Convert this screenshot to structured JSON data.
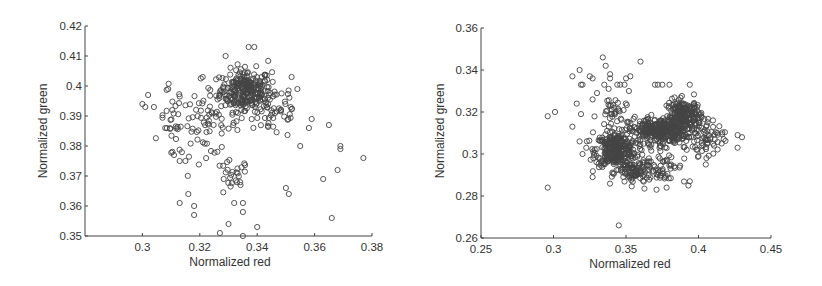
{
  "chart_data": [
    {
      "type": "scatter",
      "title": "",
      "xlabel": "Normalized red",
      "ylabel": "Normalized green",
      "xlim": [
        0.28,
        0.38
      ],
      "ylim": [
        0.35,
        0.42
      ],
      "xticks": [
        "0.3",
        "0.32",
        "0.34",
        "0.36",
        "0.38"
      ],
      "xtick_values": [
        0.3,
        0.32,
        0.34,
        0.36,
        0.38
      ],
      "yticks": [
        "0.35",
        "0.36",
        "0.37",
        "0.38",
        "0.39",
        "0.4",
        "0.41",
        "0.42"
      ],
      "ytick_values": [
        0.35,
        0.36,
        0.37,
        0.38,
        0.39,
        0.4,
        0.41,
        0.42
      ],
      "grid": false,
      "marker": "open-circle",
      "box": {
        "left": 85,
        "top": 26,
        "right": 372,
        "bottom": 236
      },
      "clusters": [
        {
          "cx": 0.336,
          "cy": 0.3985,
          "sx": 0.0045,
          "sy": 0.0035,
          "n": 260
        },
        {
          "cx": 0.322,
          "cy": 0.387,
          "sx": 0.006,
          "sy": 0.005,
          "n": 70
        },
        {
          "cx": 0.346,
          "cy": 0.392,
          "sx": 0.005,
          "sy": 0.005,
          "n": 50
        },
        {
          "cx": 0.331,
          "cy": 0.369,
          "sx": 0.003,
          "sy": 0.003,
          "n": 25
        },
        {
          "cx": 0.31,
          "cy": 0.388,
          "sx": 0.002,
          "sy": 0.006,
          "n": 25
        }
      ],
      "points": [
        [
          0.3,
          0.394
        ],
        [
          0.302,
          0.397
        ],
        [
          0.301,
          0.393
        ],
        [
          0.304,
          0.393
        ],
        [
          0.309,
          0.399
        ],
        [
          0.311,
          0.377
        ],
        [
          0.313,
          0.375
        ],
        [
          0.315,
          0.375
        ],
        [
          0.313,
          0.361
        ],
        [
          0.316,
          0.364
        ],
        [
          0.318,
          0.36
        ],
        [
          0.318,
          0.357
        ],
        [
          0.327,
          0.351
        ],
        [
          0.33,
          0.354
        ],
        [
          0.335,
          0.35
        ],
        [
          0.34,
          0.353
        ],
        [
          0.332,
          0.361
        ],
        [
          0.335,
          0.361
        ],
        [
          0.335,
          0.358
        ],
        [
          0.35,
          0.366
        ],
        [
          0.351,
          0.364
        ],
        [
          0.355,
          0.38
        ],
        [
          0.358,
          0.386
        ],
        [
          0.359,
          0.389
        ],
        [
          0.363,
          0.369
        ],
        [
          0.365,
          0.387
        ],
        [
          0.366,
          0.356
        ],
        [
          0.368,
          0.372
        ],
        [
          0.369,
          0.379
        ],
        [
          0.369,
          0.38
        ],
        [
          0.377,
          0.376
        ],
        [
          0.339,
          0.413
        ],
        [
          0.337,
          0.413
        ],
        [
          0.329,
          0.41
        ],
        [
          0.321,
          0.403
        ],
        [
          0.352,
          0.403
        ],
        [
          0.354,
          0.399
        ]
      ]
    },
    {
      "type": "scatter",
      "title": "",
      "xlabel": "Normalized red",
      "ylabel": "Normalized green",
      "xlim": [
        0.25,
        0.45
      ],
      "ylim": [
        0.26,
        0.36
      ],
      "xticks": [
        "0.25",
        "0.3",
        "0.35",
        "0.4",
        "0.45"
      ],
      "xtick_values": [
        0.25,
        0.3,
        0.35,
        0.4,
        0.45
      ],
      "yticks": [
        "0.26",
        "0.28",
        "0.3",
        "0.32",
        "0.34",
        "0.36"
      ],
      "ytick_values": [
        0.26,
        0.28,
        0.3,
        0.32,
        0.34,
        0.36
      ],
      "grid": false,
      "marker": "open-circle",
      "box": {
        "left": 481,
        "top": 28,
        "right": 771,
        "bottom": 238
      },
      "clusters": [
        {
          "cx": 0.343,
          "cy": 0.302,
          "sx": 0.007,
          "sy": 0.004,
          "n": 300
        },
        {
          "cx": 0.372,
          "cy": 0.311,
          "sx": 0.01,
          "sy": 0.003,
          "n": 300
        },
        {
          "cx": 0.39,
          "cy": 0.318,
          "sx": 0.006,
          "sy": 0.004,
          "n": 220
        },
        {
          "cx": 0.356,
          "cy": 0.291,
          "sx": 0.006,
          "sy": 0.003,
          "n": 90
        },
        {
          "cx": 0.405,
          "cy": 0.307,
          "sx": 0.006,
          "sy": 0.004,
          "n": 60
        },
        {
          "cx": 0.375,
          "cy": 0.296,
          "sx": 0.008,
          "sy": 0.005,
          "n": 60
        },
        {
          "cx": 0.34,
          "cy": 0.318,
          "sx": 0.005,
          "sy": 0.005,
          "n": 40
        }
      ],
      "points": [
        [
          0.296,
          0.284
        ],
        [
          0.296,
          0.318
        ],
        [
          0.301,
          0.32
        ],
        [
          0.313,
          0.313
        ],
        [
          0.313,
          0.337
        ],
        [
          0.316,
          0.324
        ],
        [
          0.318,
          0.34
        ],
        [
          0.319,
          0.333
        ],
        [
          0.32,
          0.333
        ],
        [
          0.319,
          0.319
        ],
        [
          0.318,
          0.306
        ],
        [
          0.32,
          0.3
        ],
        [
          0.327,
          0.289
        ],
        [
          0.325,
          0.337
        ],
        [
          0.327,
          0.336
        ],
        [
          0.327,
          0.326
        ],
        [
          0.33,
          0.329
        ],
        [
          0.334,
          0.346
        ],
        [
          0.335,
          0.333
        ],
        [
          0.336,
          0.342
        ],
        [
          0.338,
          0.331
        ],
        [
          0.339,
          0.336
        ],
        [
          0.339,
          0.338
        ],
        [
          0.344,
          0.333
        ],
        [
          0.346,
          0.333
        ],
        [
          0.349,
          0.333
        ],
        [
          0.35,
          0.336
        ],
        [
          0.352,
          0.33
        ],
        [
          0.353,
          0.337
        ],
        [
          0.36,
          0.344
        ],
        [
          0.345,
          0.266
        ],
        [
          0.37,
          0.333
        ],
        [
          0.372,
          0.333
        ],
        [
          0.375,
          0.333
        ],
        [
          0.38,
          0.333
        ],
        [
          0.394,
          0.333
        ],
        [
          0.371,
          0.283
        ],
        [
          0.378,
          0.284
        ],
        [
          0.393,
          0.285
        ],
        [
          0.394,
          0.287
        ],
        [
          0.405,
          0.295
        ],
        [
          0.4,
          0.299
        ],
        [
          0.427,
          0.303
        ],
        [
          0.427,
          0.309
        ],
        [
          0.43,
          0.308
        ],
        [
          0.416,
          0.305
        ],
        [
          0.413,
          0.31
        ],
        [
          0.41,
          0.316
        ]
      ]
    }
  ]
}
